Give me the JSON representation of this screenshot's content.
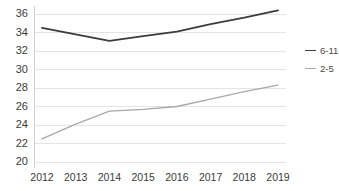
{
  "chart_data": {
    "type": "line",
    "title": "",
    "xlabel": "",
    "ylabel": "",
    "categories": [
      "2012",
      "2013",
      "2014",
      "2015",
      "2016",
      "2017",
      "2018",
      "2019"
    ],
    "x": [
      2012,
      2013,
      2014,
      2015,
      2016,
      2017,
      2018,
      2019
    ],
    "series": [
      {
        "name": "6-11",
        "color": "#3c3c3c",
        "values": [
          34.5,
          33.8,
          33.1,
          33.6,
          34.1,
          34.9,
          35.6,
          36.4
        ]
      },
      {
        "name": "2-5",
        "color": "#a8a8a8",
        "values": [
          22.5,
          24.1,
          25.5,
          25.7,
          26.0,
          26.8,
          27.6,
          28.3
        ]
      }
    ],
    "ylim": [
      20,
      36
    ],
    "yticks": [
      20,
      22,
      24,
      26,
      28,
      30,
      32,
      34,
      36
    ],
    "ytick_labels": [
      "20",
      "22",
      "24",
      "26",
      "28",
      "30",
      "32",
      "34",
      "36"
    ],
    "grid": true,
    "grid_axis": "y",
    "grid_color": "#e4e4e4",
    "axis_color": "#d0d0d0",
    "legend_position": "right",
    "legend": [
      "6-11",
      "2-5"
    ]
  }
}
